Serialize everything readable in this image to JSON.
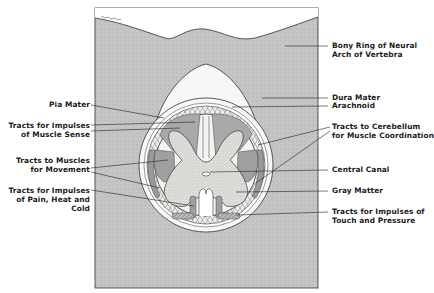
{
  "figure": {
    "signature": "signature-mark",
    "colors": {
      "bone": "#c9c9c9",
      "white_space": "#f6f6f4",
      "white_matter_tracts": "#a9a9a9",
      "gray_matter": "#d4d4d0",
      "line": "#2a2a2a"
    }
  },
  "labels": {
    "left": [
      {
        "id": "pia-mater",
        "lines": [
          "Pia Mater"
        ]
      },
      {
        "id": "muscle-sense",
        "lines": [
          "Tracts for Impulses",
          "of Muscle Sense"
        ]
      },
      {
        "id": "movement",
        "lines": [
          "Tracts to Muscles",
          "for Movement"
        ]
      },
      {
        "id": "pain-heat-cold",
        "lines": [
          "Tracts for Impulses",
          "of Pain, Heat and",
          "Cold"
        ]
      }
    ],
    "right": [
      {
        "id": "bony-ring",
        "lines": [
          "Bony Ring of Neural",
          "Arch of Vertebra"
        ]
      },
      {
        "id": "dura-mater",
        "lines": [
          "Dura Mater"
        ]
      },
      {
        "id": "arachnoid",
        "lines": [
          "Arachnoid"
        ]
      },
      {
        "id": "cerebellum",
        "lines": [
          "Tracts to Cerebellum",
          "for Muscle Coordination"
        ]
      },
      {
        "id": "central-canal",
        "lines": [
          "Central Canal"
        ]
      },
      {
        "id": "gray-matter",
        "lines": [
          "Gray Matter"
        ]
      },
      {
        "id": "touch-pressure",
        "lines": [
          "Tracts for Impulses of",
          "Touch and Pressure"
        ]
      }
    ]
  }
}
